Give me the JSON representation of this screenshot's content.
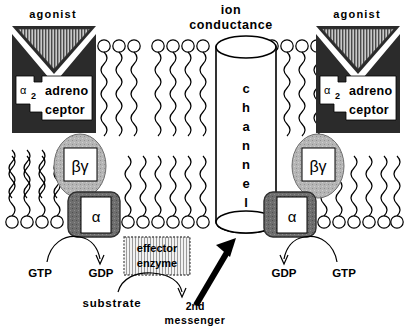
{
  "figure": {
    "title_top_center": "ion",
    "title_top_center2": "conductance",
    "agonist_left": "agonist",
    "agonist_right": "agonist"
  },
  "receptor_left": {
    "alpha_symbol": "α",
    "alpha_subscript": "2",
    "line1": "adreno",
    "line2": "ceptor"
  },
  "receptor_right": {
    "alpha_symbol": "α",
    "alpha_subscript": "2",
    "line1": "adreno",
    "line2": "ceptor"
  },
  "g_protein_left": {
    "betagamma": "βγ",
    "alpha": "α",
    "nucleotide_in": "GTP",
    "nucleotide_out": "GDP"
  },
  "g_protein_right": {
    "betagamma": "βγ",
    "alpha": "α",
    "nucleotide_in": "GTP",
    "nucleotide_out": "GDP"
  },
  "channel": {
    "letters": [
      "c",
      "h",
      "a",
      "n",
      "n",
      "e",
      "l"
    ],
    "label_line1": "ion",
    "label_line2": "conductance"
  },
  "effector": {
    "line1": "effector",
    "line2": "enzyme"
  },
  "pathway": {
    "substrate": "substrate",
    "second_messenger_line1": "2nd",
    "second_messenger_line2": "messenger"
  },
  "colors": {
    "receptor_body": "#2b2b2b",
    "agonist_stripe_dark": "#5a5a5a",
    "agonist_stripe_light": "#d8d8d8",
    "betagamma_fill": "#b3b3b3",
    "alpha_fill": "#707070",
    "effector_fill": "#e8e8e8",
    "line": "#000000",
    "white": "#ffffff"
  }
}
